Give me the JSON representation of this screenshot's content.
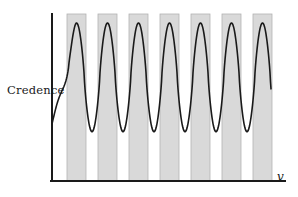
{
  "figure": {
    "background_color": "#ffffff",
    "width": 298,
    "height": 197
  },
  "axes": {
    "y_label": "Credence",
    "x_label": "v",
    "axis_color": "#1a1a1a",
    "axis_line_width": 2,
    "origin_x": 52,
    "origin_y": 181,
    "plot_right": 285,
    "plot_top": 14
  },
  "style": {
    "band_fill": "#d9d9d9",
    "band_stroke": "#b3b3b3",
    "curve_color": "#1a1a1a",
    "curve_width": 1.6
  },
  "chart_data": {
    "type": "line",
    "title": "",
    "xlabel": "v",
    "ylabel": "Credence",
    "grid": false,
    "legend": null,
    "axis_ticks": {
      "x": [],
      "y": []
    },
    "curve": {
      "name": "credence",
      "peak_count": 7,
      "peak_value": 1.0,
      "trough_value": 0.17,
      "start_value": 0.23,
      "end_value": 0.165,
      "peak_x_positions": [
        76.5,
        107.5,
        138.5,
        169.5,
        200.5,
        231.5,
        262.5
      ],
      "trough_x_positions": [
        92,
        123,
        154,
        185,
        216,
        247
      ],
      "period_px": 31,
      "x_start": 52,
      "x_end": 271
    },
    "shaded_bands": [
      {
        "index": 1,
        "x_start": 67,
        "x_end": 86,
        "center": 76.5
      },
      {
        "index": 2,
        "x_start": 98,
        "x_end": 117,
        "center": 107.5
      },
      {
        "index": 3,
        "x_start": 129,
        "x_end": 148,
        "center": 138.5
      },
      {
        "index": 4,
        "x_start": 160,
        "x_end": 179,
        "center": 169.5
      },
      {
        "index": 5,
        "x_start": 191,
        "x_end": 210,
        "center": 200.5
      },
      {
        "index": 6,
        "x_start": 222,
        "x_end": 241,
        "center": 231.5
      },
      {
        "index": 7,
        "x_start": 253,
        "x_end": 272,
        "center": 262.5
      }
    ],
    "band_top": 14,
    "band_bottom": 181
  }
}
